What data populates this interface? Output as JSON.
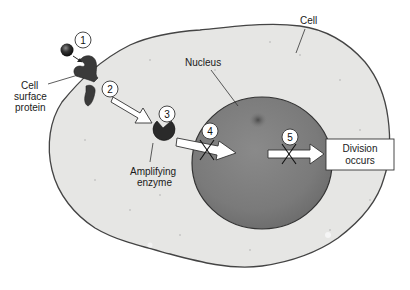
{
  "diagram": {
    "labels": {
      "cell": "Cell",
      "nucleus": "Nucleus",
      "cell_surface_protein": [
        "Cell",
        "surface",
        "protein"
      ],
      "amplifying_enzyme": [
        "Amplifying",
        "enzyme"
      ],
      "division_box": [
        "Division",
        "occurs"
      ]
    },
    "steps": [
      {
        "number": "1",
        "description": "Signal molecule binds cell surface protein"
      },
      {
        "number": "2",
        "description": "Signal passed to amplifying enzyme"
      },
      {
        "number": "3",
        "description": "Amplifying enzyme"
      },
      {
        "number": "4",
        "description": "Signal into nucleus (blocked)"
      },
      {
        "number": "5",
        "description": "Signal to division (blocked)"
      }
    ],
    "colors": {
      "cytoplasm": "#e6e6e4",
      "cell_outline": "#444444",
      "nucleus": "#7c7c7c",
      "nucleolus": "#555555",
      "protein": "#3a3a3a",
      "arrow_fill": "#ffffff"
    }
  }
}
